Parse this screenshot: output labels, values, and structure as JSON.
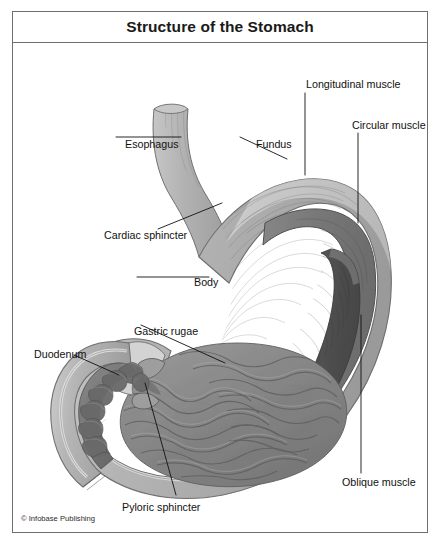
{
  "figure": {
    "title": "Structure of the Stomach",
    "credit": "© Infobase Publishing",
    "frame_color": "#6e6e6e",
    "background": "#ffffff"
  },
  "palette": {
    "wall_light": "#b9b9b9",
    "wall_mid": "#a5a5a5",
    "wall_outline": "#707070",
    "serosa_pale": "#dcdcdc",
    "circular_muscle": "#7e7e7e",
    "oblique_muscle": "#5a5a5a",
    "lumen_rugae": "#8b8b8b",
    "rugae_fold": "#6a6a6a",
    "duodenum_fold": "#787878",
    "leader_line": "#111111",
    "label_text": "#111111"
  },
  "labels": [
    {
      "id": "esophagus",
      "text": "Esophagus",
      "x": 113,
      "y": 128
    },
    {
      "id": "fundus",
      "text": "Fundus",
      "x": 244,
      "y": 128
    },
    {
      "id": "longitudinal-muscle",
      "text": "Longitudinal muscle",
      "x": 294,
      "y": 68
    },
    {
      "id": "circular-muscle",
      "text": "Circular muscle",
      "x": 340,
      "y": 109
    },
    {
      "id": "cardiac-sphincter",
      "text": "Cardiac sphincter",
      "x": 92,
      "y": 219
    },
    {
      "id": "body",
      "text": "Body",
      "x": 182,
      "y": 266
    },
    {
      "id": "gastric-rugae",
      "text": "Gastric rugae",
      "x": 122,
      "y": 315
    },
    {
      "id": "duodenum",
      "text": "Duodenum",
      "x": 22,
      "y": 338
    },
    {
      "id": "oblique-muscle",
      "text": "Oblique muscle",
      "x": 330,
      "y": 466
    },
    {
      "id": "pyloric-sphincter",
      "text": "Pyloric sphincter",
      "x": 110,
      "y": 491
    }
  ],
  "structures": [
    "esophagus-tube",
    "cardiac-sphincter-region",
    "fundus-dome",
    "stomach-body-wall",
    "longitudinal-muscle-layer",
    "circular-muscle-cutaway",
    "oblique-muscle-cutaway",
    "gastric-rugae-lumen",
    "pyloric-sphincter-region",
    "duodenum-segment"
  ]
}
